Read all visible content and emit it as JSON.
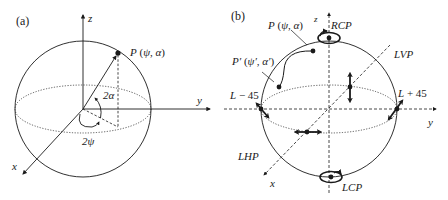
{
  "panel_a": {
    "label": "(a)",
    "axis_z": "z",
    "axis_y": "y",
    "axis_x": "x",
    "point_label": "P (ψ, α)",
    "angle_alpha": "2α",
    "angle_psi": "2ψ"
  },
  "panel_b": {
    "label": "(b)",
    "axis_z": "z",
    "axis_y": "y",
    "axis_x": "x",
    "point_p": "P (ψ, α)",
    "point_p_prime": "P′ (ψ′, α′)",
    "rcp": "RCP",
    "lcp": "LCP",
    "lvp": "LVP",
    "lhp": "LHP",
    "l_minus_45": "L − 45",
    "l_plus_45": "L + 45"
  },
  "colors": {
    "stroke": "#1a1a1a",
    "background": "#ffffff"
  }
}
